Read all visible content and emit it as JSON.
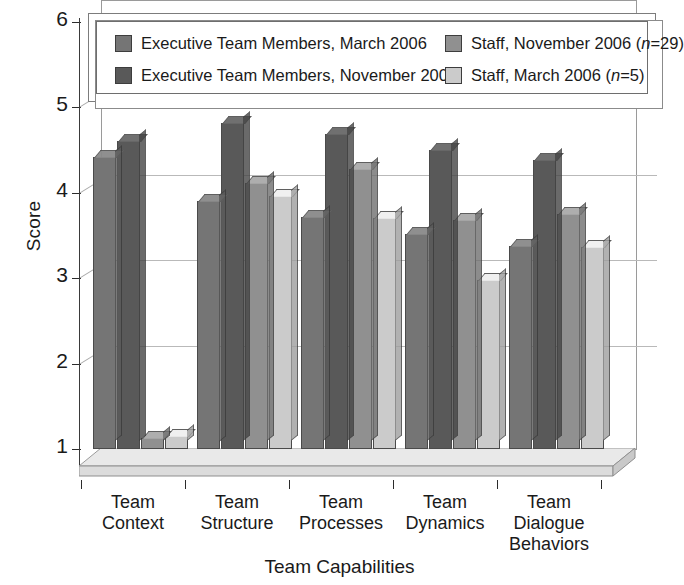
{
  "chart_data": {
    "type": "bar",
    "title": "",
    "xlabel": "Team Capabilities",
    "ylabel": "Score",
    "ylim": [
      1,
      6
    ],
    "yticks": [
      1,
      2,
      3,
      4,
      5,
      6
    ],
    "grid": true,
    "legend_position": "top",
    "categories": [
      "Team\nContext",
      "Team\nStructure",
      "Team\nProcesses",
      "Team\nDynamics",
      "Team\nDialogue\nBehaviors"
    ],
    "category_lines": [
      [
        "Team",
        "Context"
      ],
      [
        "Team",
        "Structure"
      ],
      [
        "Team",
        "Processes"
      ],
      [
        "Team",
        "Dynamics"
      ],
      [
        "Team",
        "Dialogue",
        "Behaviors"
      ]
    ],
    "series": [
      {
        "name": "Executive Team Members, March 2006",
        "color": "#757575",
        "values": [
          4.42,
          3.91,
          3.72,
          3.52,
          3.38
        ]
      },
      {
        "name": "Executive Team Members, November 2006",
        "color": "#595959",
        "values": [
          4.61,
          4.82,
          4.69,
          4.5,
          4.38
        ]
      },
      {
        "name": "Staff, November 2006 (n=29)",
        "color": "#909090",
        "values": [
          1.13,
          4.11,
          4.28,
          3.68,
          3.75
        ]
      },
      {
        "name": "Staff, March 2006 (n=5)",
        "color": "#cbcbcb",
        "values": [
          1.15,
          3.96,
          3.7,
          2.98,
          3.37
        ]
      }
    ]
  },
  "axes": {
    "y_title": "Score",
    "x_title": "Team Capabilities",
    "y_tick_labels": [
      "6",
      "5",
      "4",
      "3",
      "2",
      "1"
    ]
  },
  "legend": {
    "entries": [
      {
        "label_main": "Executive Team Members, March 2006",
        "n_prefix": "",
        "n_italic": "",
        "n_suffix": "",
        "color": "#757575",
        "row": 0,
        "col": 0
      },
      {
        "label_main": "Executive Team Members, November 2006",
        "n_prefix": "",
        "n_italic": "",
        "n_suffix": "",
        "color": "#595959",
        "row": 1,
        "col": 0
      },
      {
        "label_main": "Staff, November 2006 (",
        "n_italic": "n",
        "n_suffix": "=29)",
        "color": "#909090",
        "row": 0,
        "col": 1
      },
      {
        "label_main": "Staff, March 2006 (",
        "n_italic": "n",
        "n_suffix": "=5)",
        "color": "#cbcbcb",
        "row": 1,
        "col": 1
      }
    ]
  }
}
